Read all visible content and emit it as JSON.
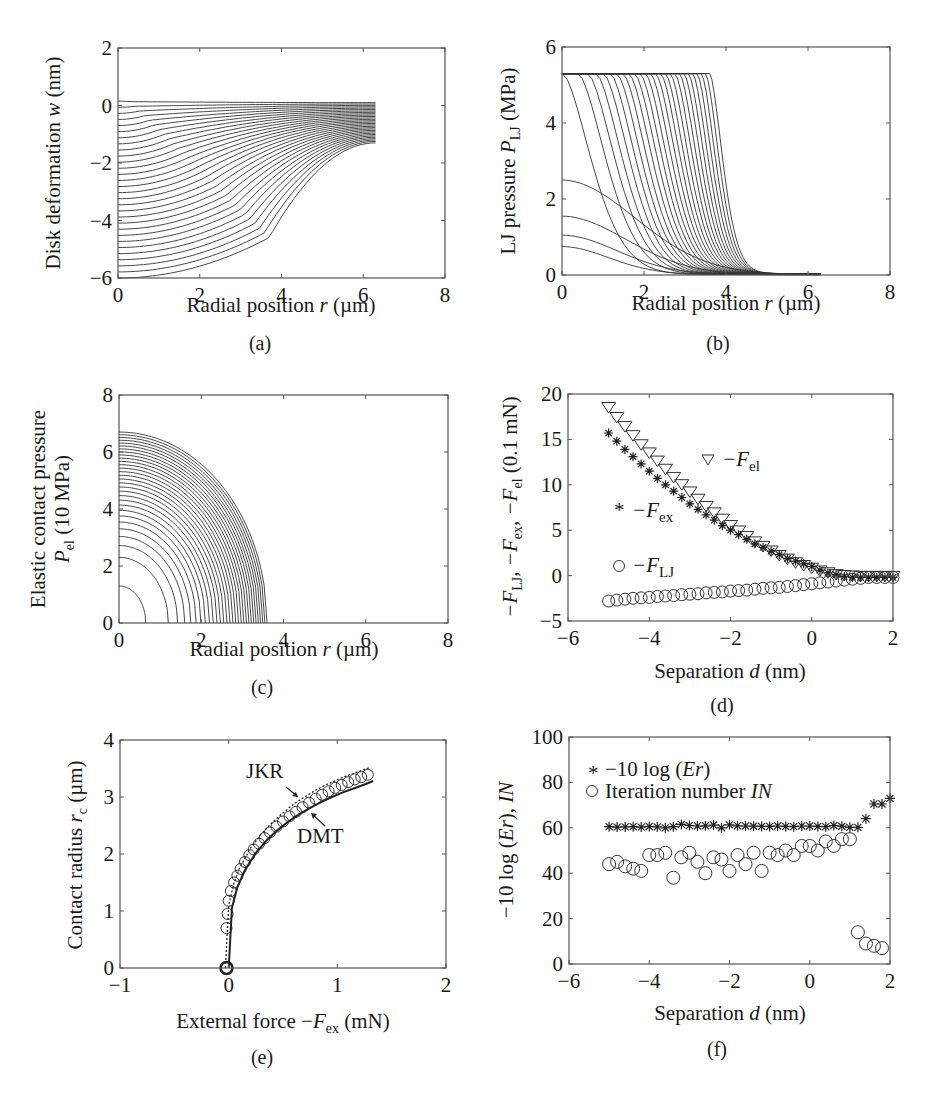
{
  "figure": {
    "captions": [
      "(a)",
      "(b)",
      "(c)",
      "(d)",
      "(e)",
      "(f)"
    ]
  },
  "chart_data": [
    {
      "id": "a",
      "type": "line",
      "caption": "(a)",
      "xlabel": "Radial position r (µm)",
      "ylabel": "Disk deformation w (nm)",
      "xlim": [
        0,
        8
      ],
      "ylim": [
        -6,
        2
      ],
      "xticks": [
        "0",
        "2",
        "4",
        "6",
        "8"
      ],
      "yticks": [
        "-6",
        "-4",
        "-2",
        "0",
        "2"
      ],
      "grid": false,
      "family": {
        "count": 30,
        "r_max": 6.3,
        "center_deflection_range": [
          0.15,
          -6.0
        ],
        "edge_deflection_range": [
          0.1,
          -1.3
        ],
        "description": "Family of deflection profiles w(r), deepest center deflection about -6 nm, converging near -1.3 to 0.1 nm at r = 6.3 µm"
      }
    },
    {
      "id": "b",
      "type": "line",
      "caption": "(b)",
      "xlabel": "Radial position r (µm)",
      "ylabel": "LJ pressure P_LJ (MPa)",
      "xlim": [
        0,
        8
      ],
      "ylim": [
        0,
        6
      ],
      "xticks": [
        "0",
        "2",
        "4",
        "6",
        "8"
      ],
      "yticks": [
        "0",
        "2",
        "4",
        "6"
      ],
      "grid": false,
      "family": {
        "count": 30,
        "plateau": 5.3,
        "low_center_peaks": [
          0.7,
          1.0,
          1.5,
          2.45
        ],
        "plateau_edge_range": [
          0.0,
          3.6
        ],
        "tail_end_r": 6.3,
        "description": "LJ pressure profiles saturating at 5.3 MPa plateau, dropping to ~0 by r ≈ 5–6.3 µm"
      }
    },
    {
      "id": "c",
      "type": "line",
      "caption": "(c)",
      "xlabel": "Radial position r (µm)",
      "ylabel": "Elastic contact pressure P_el (10 MPa)",
      "xlim": [
        0,
        8
      ],
      "ylim": [
        0,
        8
      ],
      "xticks": [
        "0",
        "2",
        "4",
        "6",
        "8"
      ],
      "yticks": [
        "0",
        "2",
        "4",
        "6",
        "8"
      ],
      "grid": false,
      "family": {
        "count": 30,
        "peak_range": [
          1.3,
          6.7
        ],
        "radius_range": [
          0.65,
          3.6
        ],
        "description": "Hertz-like elliptical pressure distributions; largest peak 6.7 at r=0, contact radius up to 3.6 µm"
      }
    },
    {
      "id": "d",
      "type": "scatter",
      "caption": "(d)",
      "xlabel": "Separation d (nm)",
      "ylabel": "-F_LJ, -F_ex, -F_el (0.1 mN)",
      "xlim": [
        -6,
        2
      ],
      "ylim": [
        -5,
        20
      ],
      "xticks": [
        "-6",
        "-4",
        "-2",
        "0",
        "2"
      ],
      "yticks": [
        "-5",
        "0",
        "5",
        "10",
        "15",
        "20"
      ],
      "grid": false,
      "x": [
        -5.0,
        -4.8,
        -4.6,
        -4.4,
        -4.2,
        -4.0,
        -3.8,
        -3.6,
        -3.4,
        -3.2,
        -3.0,
        -2.8,
        -2.6,
        -2.4,
        -2.2,
        -2.0,
        -1.8,
        -1.6,
        -1.4,
        -1.2,
        -1.0,
        -0.8,
        -0.6,
        -0.4,
        -0.2,
        0.0,
        0.2,
        0.4,
        0.6,
        0.8,
        1.0,
        1.2,
        1.4,
        1.6,
        1.8,
        2.0
      ],
      "series": [
        {
          "name": "-F_el",
          "marker": "triangle-down",
          "values": [
            18.6,
            17.5,
            16.5,
            15.5,
            14.5,
            13.6,
            12.7,
            11.8,
            10.9,
            10.1,
            9.3,
            8.5,
            7.7,
            7.0,
            6.3,
            5.6,
            5.0,
            4.4,
            3.8,
            3.3,
            2.8,
            2.3,
            1.9,
            1.5,
            1.2,
            0.9,
            0.6,
            0.4,
            0.2,
            0.1,
            0.05,
            0.0,
            0.0,
            0.0,
            0.0,
            0.0
          ]
        },
        {
          "name": "-F_ex",
          "marker": "star",
          "values": [
            15.7,
            14.8,
            13.9,
            13.1,
            12.3,
            11.5,
            10.7,
            10.0,
            9.3,
            8.6,
            7.9,
            7.3,
            6.7,
            6.1,
            5.5,
            5.0,
            4.5,
            4.0,
            3.5,
            3.1,
            2.7,
            2.3,
            1.9,
            1.6,
            1.3,
            1.0,
            0.6,
            0.3,
            0.1,
            -0.1,
            -0.2,
            -0.2,
            -0.2,
            -0.2,
            -0.2,
            -0.2
          ]
        },
        {
          "name": "-F_LJ",
          "marker": "circle",
          "values": [
            -2.8,
            -2.7,
            -2.6,
            -2.5,
            -2.45,
            -2.4,
            -2.3,
            -2.25,
            -2.2,
            -2.1,
            -2.05,
            -2.0,
            -1.9,
            -1.85,
            -1.8,
            -1.7,
            -1.65,
            -1.6,
            -1.5,
            -1.4,
            -1.35,
            -1.3,
            -1.2,
            -1.1,
            -1.0,
            -0.9,
            -0.8,
            -0.7,
            -0.6,
            -0.5,
            -0.4,
            -0.3,
            -0.2,
            -0.2,
            -0.2,
            -0.2
          ]
        }
      ],
      "legend": [
        {
          "label": "-F_el",
          "marker": "▽"
        },
        {
          "label": "-F_ex",
          "marker": "*"
        },
        {
          "label": "-F_LJ",
          "marker": "○"
        }
      ]
    },
    {
      "id": "e",
      "type": "line",
      "caption": "(e)",
      "xlabel": "External force -F_ex (mN)",
      "ylabel": "Contact radius r_c (µm)",
      "xlim": [
        -1,
        2
      ],
      "ylim": [
        0,
        4
      ],
      "xticks": [
        "-1",
        "0",
        "1",
        "2"
      ],
      "yticks": [
        "0",
        "1",
        "2",
        "3",
        "4"
      ],
      "grid": false,
      "annotations": [
        "JKR",
        "DMT"
      ],
      "series": [
        {
          "name": "Simulation (circles)",
          "marker": "circle",
          "x": [
            -0.02,
            -0.02,
            -0.01,
            0.0,
            0.02,
            0.05,
            0.08,
            0.11,
            0.15,
            0.19,
            0.23,
            0.28,
            0.33,
            0.38,
            0.44,
            0.5,
            0.56,
            0.62,
            0.68,
            0.74,
            0.8,
            0.86,
            0.92,
            0.98,
            1.04,
            1.1,
            1.16,
            1.22,
            1.28
          ],
          "y": [
            0.0,
            0.7,
            0.95,
            1.18,
            1.35,
            1.5,
            1.62,
            1.74,
            1.86,
            1.98,
            2.08,
            2.18,
            2.28,
            2.38,
            2.48,
            2.57,
            2.66,
            2.74,
            2.82,
            2.9,
            2.97,
            3.04,
            3.1,
            3.16,
            3.21,
            3.26,
            3.31,
            3.35,
            3.39
          ]
        },
        {
          "name": "JKR",
          "x": [
            -0.03,
            0.0,
            0.05,
            0.1,
            0.2,
            0.3,
            0.4,
            0.5,
            0.6,
            0.7,
            0.8,
            0.9,
            1.0,
            1.1,
            1.2,
            1.3
          ],
          "y": [
            0.0,
            1.1,
            1.5,
            1.75,
            2.1,
            2.35,
            2.55,
            2.72,
            2.88,
            3.0,
            3.12,
            3.22,
            3.3,
            3.38,
            3.45,
            3.52
          ]
        },
        {
          "name": "DMT",
          "x": [
            0.0,
            0.03,
            0.08,
            0.15,
            0.25,
            0.35,
            0.45,
            0.55,
            0.65,
            0.75,
            0.85,
            0.95,
            1.05,
            1.15,
            1.25,
            1.33
          ],
          "y": [
            0.0,
            1.05,
            1.42,
            1.72,
            2.02,
            2.24,
            2.42,
            2.57,
            2.7,
            2.81,
            2.91,
            3.0,
            3.08,
            3.15,
            3.22,
            3.28
          ]
        }
      ]
    },
    {
      "id": "f",
      "type": "scatter",
      "caption": "(f)",
      "xlabel": "Separation d (nm)",
      "ylabel": "-10 log (Er), IN",
      "xlim": [
        -6,
        2
      ],
      "ylim": [
        0,
        100
      ],
      "xticks": [
        "-6",
        "-4",
        "-2",
        "0",
        "2"
      ],
      "yticks": [
        "0",
        "20",
        "40",
        "60",
        "80",
        "100"
      ],
      "grid": false,
      "x": [
        -5.0,
        -4.8,
        -4.6,
        -4.4,
        -4.2,
        -4.0,
        -3.8,
        -3.6,
        -3.4,
        -3.2,
        -3.0,
        -2.8,
        -2.6,
        -2.4,
        -2.2,
        -2.0,
        -1.8,
        -1.6,
        -1.4,
        -1.2,
        -1.0,
        -0.8,
        -0.6,
        -0.4,
        -0.2,
        0.0,
        0.2,
        0.4,
        0.6,
        0.8,
        1.0,
        1.2,
        1.4,
        1.6,
        1.8,
        2.0
      ],
      "series": [
        {
          "name": "-10 log (Er)",
          "marker": "star",
          "values": [
            60.5,
            60.3,
            60.4,
            60.5,
            60.3,
            60.6,
            60.4,
            60.0,
            60.5,
            61.5,
            61.0,
            60.8,
            60.9,
            61.2,
            60.0,
            61.3,
            60.9,
            60.8,
            60.7,
            60.6,
            60.6,
            60.8,
            60.6,
            60.5,
            60.8,
            60.8,
            60.6,
            60.5,
            61.0,
            60.7,
            60.2,
            60.2,
            64.0,
            70.5,
            70.5,
            73.0
          ]
        },
        {
          "name": "Iteration number IN",
          "marker": "circle",
          "values": [
            44,
            45,
            43,
            42,
            41,
            48,
            48,
            49,
            38,
            47,
            49,
            45,
            40,
            47,
            46,
            41,
            48,
            44,
            49,
            41,
            49,
            48,
            50,
            48,
            52,
            52,
            50,
            54,
            52,
            55,
            55,
            14,
            9,
            8,
            7,
            null
          ]
        }
      ],
      "legend": [
        {
          "label": "-10 log (Er)",
          "marker": "*"
        },
        {
          "label": "Iteration number IN",
          "marker": "○"
        }
      ]
    }
  ],
  "labels": {
    "a": {
      "y_main": "Disk deformation ",
      "y_it": "w",
      "y_tail": " (nm)",
      "x_main": "Radial position ",
      "x_it": "r",
      "x_tail": " (µm)"
    },
    "b": {
      "y_main": "LJ pressure ",
      "y_it": "P",
      "y_sub": "LJ",
      "y_tail": " (MPa)",
      "x_main": "Radial position ",
      "x_it": "r",
      "x_tail": " (µm)"
    },
    "c": {
      "y_line1": "Elastic contact pressure",
      "y_it": "P",
      "y_sub": "el",
      "y_tail": " (10 MPa)",
      "x_main": "Radial position ",
      "x_it": "r",
      "x_tail": " (µm)"
    },
    "d": {
      "y_text": "−F",
      "y_sub1": "LJ",
      "y_mid1": ", −F",
      "y_sub2": "ex",
      "y_mid2": ", −F",
      "y_sub3": "el",
      "y_tail": " (0.1 mN)",
      "x_main": "Separation ",
      "x_it": "d",
      "x_tail": " (nm)",
      "leg_el": "−F",
      "leg_el_sub": "el",
      "leg_ex": "−F",
      "leg_ex_sub": "ex",
      "leg_lj": "−F",
      "leg_lj_sub": "LJ"
    },
    "e": {
      "y_main": "Contact radius ",
      "y_it": "r",
      "y_sub": "c",
      "y_tail": " (µm)",
      "x_main": "External force −",
      "x_it": "F",
      "x_sub": "ex",
      "x_tail": " (mN)",
      "jkr": "JKR",
      "dmt": "DMT"
    },
    "f": {
      "y_main": "−10 log (",
      "y_it": "Er",
      "y_mid": "), ",
      "y_it2": "IN",
      "x_main": "Separation ",
      "x_it": "d",
      "x_tail": " (nm)",
      "leg1_main": "−10 log (",
      "leg1_it": "Er",
      "leg1_tail": ")",
      "leg2_main": "Iteration number ",
      "leg2_it": "IN"
    }
  }
}
